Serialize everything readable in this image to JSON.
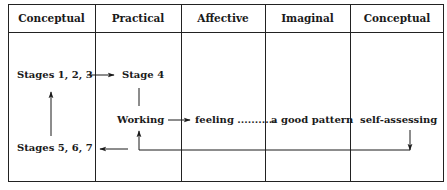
{
  "header": {
    "columns": [
      "Conceptual",
      "Practical",
      "Affective",
      "Imaginal",
      "Conceptual"
    ]
  },
  "nodes": {
    "stages_123": "Stages 1, 2, 3",
    "stage_4": "Stage 4",
    "working": "Working",
    "feeling": "feeling ...........",
    "good_pattern": "a good pattern",
    "self_assessing": "self-assessing",
    "stages_567": "Stages 5, 6, 7"
  },
  "edges": [
    {
      "from": "Stages 1, 2, 3",
      "to": "Stage 4",
      "type": "arrow"
    },
    {
      "from": "Stage 4",
      "to": "Working",
      "type": "line"
    },
    {
      "from": "Working",
      "to": "feeling",
      "type": "arrow"
    },
    {
      "from": "feeling",
      "to": "a good pattern",
      "type": "dotted"
    },
    {
      "from": "self-assessing",
      "to": "Working",
      "type": "return-arrow"
    },
    {
      "from": "Working",
      "to": "Stages 5, 6, 7",
      "type": "arrow"
    },
    {
      "from": "Stages 5, 6, 7",
      "to": "Stages 1, 2, 3",
      "type": "arrow"
    }
  ]
}
